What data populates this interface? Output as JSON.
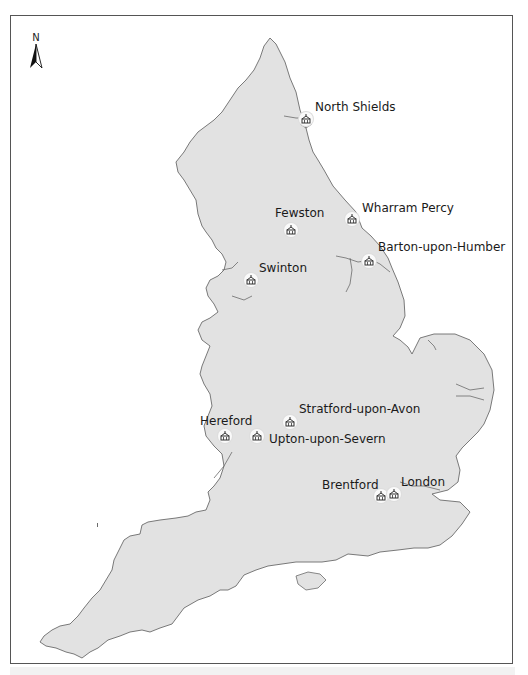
{
  "map": {
    "title": "",
    "north_arrow": {
      "label": "N",
      "icon": "north-arrow-icon"
    },
    "colors": {
      "land": "#e2e2e2",
      "coast": "#6b6b6b",
      "background": "#ffffff",
      "frame": "#555555"
    },
    "sites": [
      {
        "name": "North Shields",
        "x": 306,
        "y": 119,
        "label_x": 315,
        "label_y": 100
      },
      {
        "name": "Fewston",
        "x": 291,
        "y": 230,
        "label_x": 275,
        "label_y": 206
      },
      {
        "name": "Wharram Percy",
        "x": 352,
        "y": 219,
        "label_x": 362,
        "label_y": 201
      },
      {
        "name": "Barton-upon-Humber",
        "x": 369,
        "y": 261,
        "label_x": 378,
        "label_y": 240
      },
      {
        "name": "Swinton",
        "x": 251,
        "y": 280,
        "label_x": 259,
        "label_y": 261
      },
      {
        "name": "Stratford-upon-Avon",
        "x": 290,
        "y": 422,
        "label_x": 299,
        "label_y": 402
      },
      {
        "name": "Hereford",
        "x": 225,
        "y": 436,
        "label_x": 200,
        "label_y": 414
      },
      {
        "name": "Upton-upon-Severn",
        "x": 257,
        "y": 436,
        "label_x": 269,
        "label_y": 432
      },
      {
        "name": "Brentford",
        "x": 381,
        "y": 496,
        "label_x": 322,
        "label_y": 478
      },
      {
        "name": "London",
        "x": 394,
        "y": 494,
        "label_x": 401,
        "label_y": 475
      }
    ],
    "marker_icon": "church-icon"
  }
}
